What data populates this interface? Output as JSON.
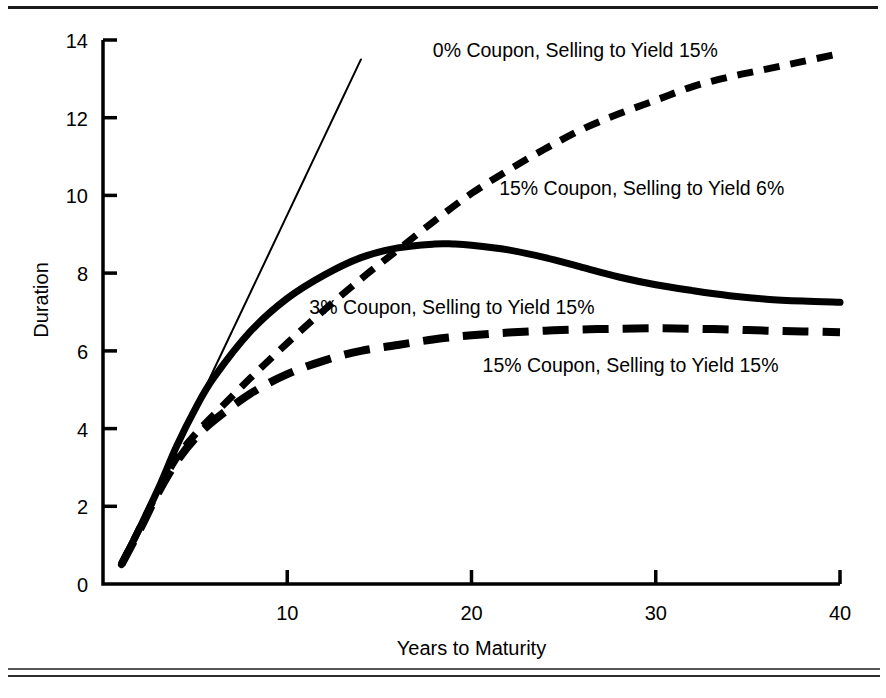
{
  "figure": {
    "background_color": "#ffffff",
    "ink_color": "#000000",
    "top_rule_color": "#1a1a1a",
    "bottom_rule_color": "#2c2c2c"
  },
  "chart_data": {
    "type": "line",
    "title": "",
    "subtitle": "",
    "xlabel": "Years to Maturity",
    "ylabel": "Duration",
    "xlim": [
      0,
      40
    ],
    "ylim": [
      0,
      14
    ],
    "xticks": [
      10,
      20,
      30,
      40
    ],
    "xtick_labels": [
      "10",
      "20",
      "30",
      "40"
    ],
    "yticks": [
      0,
      2,
      4,
      6,
      8,
      10,
      12,
      14
    ],
    "ytick_labels": [
      "0",
      "2",
      "4",
      "6",
      "8",
      "10",
      "12",
      "14"
    ],
    "grid": false,
    "legend": "inline-annotations",
    "series": [
      {
        "name": "0% Coupon, Selling to Yield 15%",
        "label": "0% Coupon, Selling to Yield 15%",
        "style": "solid-thin",
        "stroke_width": 2,
        "dash": "none",
        "label_x": 17.9,
        "label_y": 13.55,
        "x": [
          1,
          2,
          3,
          4,
          5,
          6,
          7,
          8,
          9,
          10,
          11,
          12,
          13,
          14
        ],
        "values": [
          0.5,
          1.5,
          2.5,
          3.5,
          4.5,
          5.5,
          6.5,
          7.5,
          8.5,
          9.5,
          10.5,
          11.5,
          12.5,
          13.5
        ]
      },
      {
        "name": "15% Coupon, Selling to Yield 6%",
        "label": "15% Coupon, Selling to Yield 6%",
        "style": "short-dash",
        "stroke_width": 7,
        "dash": "16 11",
        "label_x": 21.5,
        "label_y": 10.0,
        "x": [
          1,
          2,
          3,
          4,
          5,
          6,
          8,
          10,
          12,
          14,
          16,
          18,
          20,
          22,
          24,
          26,
          28,
          30,
          32,
          34,
          36,
          38,
          40
        ],
        "values": [
          0.5,
          1.45,
          2.4,
          3.25,
          3.85,
          4.35,
          5.3,
          6.2,
          7.05,
          7.85,
          8.6,
          9.35,
          10.05,
          10.65,
          11.2,
          11.7,
          12.1,
          12.45,
          12.8,
          13.05,
          13.25,
          13.45,
          13.65
        ]
      },
      {
        "name": "3% Coupon, Selling to Yield 15%",
        "label": "3% Coupon, Selling to Yield 15%",
        "style": "solid-thick",
        "stroke_width": 7,
        "dash": "none",
        "label_x": 11.2,
        "label_y": 6.95,
        "x": [
          1,
          2,
          3,
          4,
          5,
          6,
          8,
          10,
          12,
          14,
          16,
          18,
          19,
          20,
          22,
          24,
          26,
          28,
          30,
          32,
          34,
          36,
          38,
          40
        ],
        "values": [
          0.5,
          1.45,
          2.45,
          3.55,
          4.5,
          5.3,
          6.5,
          7.35,
          7.95,
          8.4,
          8.65,
          8.75,
          8.75,
          8.72,
          8.6,
          8.4,
          8.15,
          7.9,
          7.7,
          7.55,
          7.42,
          7.33,
          7.28,
          7.25
        ]
      },
      {
        "name": "15% Coupon, Selling to Yield 15%",
        "label": "15% Coupon, Selling to Yield 15%",
        "style": "long-dash",
        "stroke_width": 8,
        "dash": "26 14",
        "label_x": 20.6,
        "label_y": 5.45,
        "x": [
          1,
          2,
          3,
          4,
          5,
          6,
          8,
          10,
          12,
          14,
          16,
          18,
          20,
          22,
          24,
          26,
          28,
          30,
          32,
          34,
          36,
          38,
          40
        ],
        "values": [
          0.5,
          1.4,
          2.35,
          3.15,
          3.75,
          4.2,
          4.9,
          5.4,
          5.75,
          6.0,
          6.15,
          6.3,
          6.4,
          6.47,
          6.52,
          6.55,
          6.57,
          6.58,
          6.57,
          6.55,
          6.52,
          6.5,
          6.48
        ]
      }
    ]
  }
}
